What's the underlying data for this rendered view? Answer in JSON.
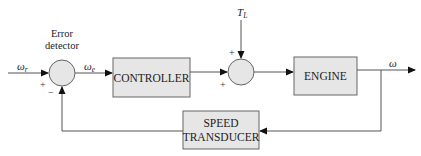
{
  "diagram": {
    "type": "closed-loop control block diagram",
    "colors": {
      "block_fill": "#e6e6e6",
      "block_stroke": "#666666",
      "line": "#555555",
      "arrow": "#111111",
      "background": "#ffffff"
    },
    "signals": {
      "reference": {
        "symbol": "ω",
        "subscript": "r"
      },
      "error": {
        "symbol": "ω",
        "subscript": "e"
      },
      "load_torque": {
        "symbol": "T",
        "subscript": "L"
      },
      "output": {
        "symbol": "ω"
      }
    },
    "summing_junctions": [
      {
        "id": "error-detector",
        "label_line1": "Error",
        "label_line2": "detector",
        "signs": {
          "left": "+",
          "bottom": "−"
        }
      },
      {
        "id": "disturbance-junction",
        "signs": {
          "top": "+",
          "left": "+"
        }
      }
    ],
    "blocks": [
      {
        "id": "controller",
        "label": "CONTROLLER"
      },
      {
        "id": "engine",
        "label": "ENGINE"
      },
      {
        "id": "speed-transducer",
        "label_line1": "SPEED",
        "label_line2": "TRANSDUCER"
      }
    ]
  }
}
